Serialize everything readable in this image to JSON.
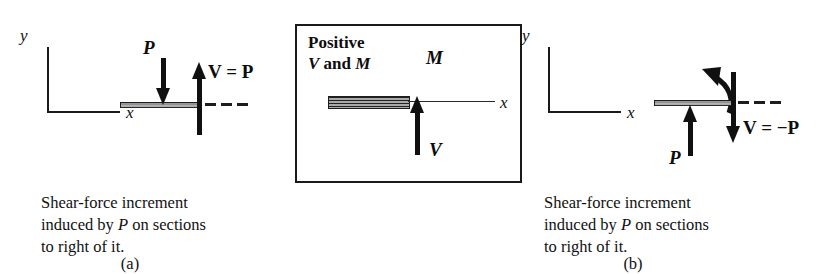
{
  "figure": {
    "background_color": "#ffffff",
    "ink_color": "#111111",
    "beam_fill_color": "#a8a8a8"
  },
  "panel_a": {
    "tag": "(a)",
    "axis_y_label": "y",
    "axis_x_label": "x",
    "load_label": "P",
    "load_direction": "down",
    "shear_label_prefix": "V",
    "shear_label_equals": "=",
    "shear_label_value": "P",
    "shear_label_full": "V = P",
    "shear_direction": "up",
    "dash_count": 3,
    "caption_lines": [
      "Shear-force increment",
      "induced by P on sections",
      "to right of it."
    ],
    "caption_line2_pre": "induced by ",
    "caption_line2_italic": "P",
    "caption_line2_post": " on sections"
  },
  "panel_middle": {
    "title_line1": "Positive",
    "title_line2_pre": "V",
    "title_line2_mid": " and ",
    "title_line2_post": "M",
    "title_line2_full": "V and M",
    "axis_x_label": "x",
    "moment_label": "M",
    "moment_direction": "counterclockwise",
    "shear_label": "V",
    "shear_direction": "up",
    "box_border_color": "#1a1a1a"
  },
  "panel_b": {
    "tag": "(b)",
    "axis_y_label": "y",
    "axis_x_label": "x",
    "load_label": "P",
    "load_direction": "up",
    "shear_label_prefix": "V",
    "shear_label_equals": "=",
    "shear_label_value": "−P",
    "shear_label_full": "V = −P",
    "shear_direction": "down",
    "dash_count": 3,
    "caption_lines": [
      "Shear-force increment",
      "induced by P on sections",
      "to right of it."
    ],
    "caption_line2_pre": "induced by ",
    "caption_line2_italic": "P",
    "caption_line2_post": " on sections"
  }
}
